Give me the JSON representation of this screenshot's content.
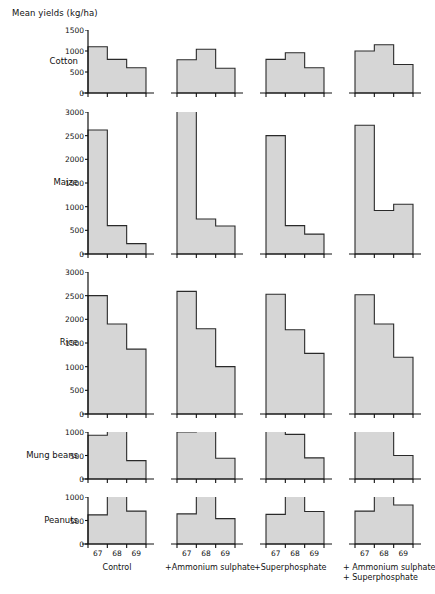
{
  "title": "Mean yields (kg/ha)",
  "colors": {
    "bar_fill": "#d6d6d6",
    "bar_stroke": "#2a2a2a",
    "axis": "#111111",
    "background": "#ffffff"
  },
  "x_tick_labels": [
    "67",
    "68",
    "69"
  ],
  "treatments": [
    {
      "id": "control",
      "label": "Control"
    },
    {
      "id": "ammonium-sulphate",
      "label": "+Ammonium sulphate"
    },
    {
      "id": "superphosphate",
      "label": "+Superphosphate"
    },
    {
      "id": "ammonium-sulphate-superphosphate",
      "label": "+ Ammonium sulphate\n+ Superphosphate"
    }
  ],
  "crops": [
    {
      "id": "cotton",
      "label": "Cotton",
      "ymax": 1500,
      "ystep": 500,
      "yticks": [
        0,
        500,
        1000,
        1500
      ]
    },
    {
      "id": "maize",
      "label": "Maize",
      "ymax": 3000,
      "ystep": 500,
      "yticks": [
        0,
        500,
        1000,
        1500,
        2000,
        2500,
        3000
      ]
    },
    {
      "id": "rice",
      "label": "Rice",
      "ymax": 3000,
      "ystep": 500,
      "yticks": [
        0,
        500,
        1000,
        1500,
        2000,
        2500,
        3000
      ]
    },
    {
      "id": "mung-beans",
      "label": "Mung beans",
      "ymax": 1000,
      "ystep": 500,
      "yticks": [
        0,
        500,
        1000
      ]
    },
    {
      "id": "peanuts",
      "label": "Peanuts",
      "ymax": 1000,
      "ystep": 500,
      "yticks": [
        0,
        500,
        1000
      ]
    }
  ],
  "chart_data": {
    "type": "bar",
    "title": "Mean yields (kg/ha)",
    "xlabel": "",
    "ylabel": "Mean yields (kg/ha)",
    "grid": false,
    "legend": "none",
    "layout": "small-multiples grid: 5 crop rows x 4 treatment columns",
    "categories": [
      "67",
      "68",
      "69"
    ],
    "panels": [
      {
        "crop": "Cotton",
        "treatment": "Control",
        "ylim": [
          0,
          1500
        ],
        "values": [
          1100,
          800,
          600
        ]
      },
      {
        "crop": "Cotton",
        "treatment": "+Ammonium sulphate",
        "ylim": [
          0,
          1500
        ],
        "values": [
          790,
          1040,
          590
        ]
      },
      {
        "crop": "Cotton",
        "treatment": "+Superphosphate",
        "ylim": [
          0,
          1500
        ],
        "values": [
          800,
          960,
          600
        ]
      },
      {
        "crop": "Cotton",
        "treatment": "+ Ammonium sulphate + Superphosphate",
        "ylim": [
          0,
          1500
        ],
        "values": [
          1000,
          1150,
          680
        ]
      },
      {
        "crop": "Maize",
        "treatment": "Control",
        "ylim": [
          0,
          3000
        ],
        "values": [
          2620,
          600,
          220
        ]
      },
      {
        "crop": "Maize",
        "treatment": "+Ammonium sulphate",
        "ylim": [
          0,
          3000
        ],
        "values": [
          3080,
          740,
          590
        ]
      },
      {
        "crop": "Maize",
        "treatment": "+Superphosphate",
        "ylim": [
          0,
          3000
        ],
        "values": [
          2500,
          600,
          420
        ]
      },
      {
        "crop": "Maize",
        "treatment": "+ Ammonium sulphate + Superphosphate",
        "ylim": [
          0,
          3000
        ],
        "values": [
          2720,
          920,
          1050
        ]
      },
      {
        "crop": "Rice",
        "treatment": "Control",
        "ylim": [
          0,
          3000
        ],
        "values": [
          2500,
          1900,
          1370
        ]
      },
      {
        "crop": "Rice",
        "treatment": "+Ammonium sulphate",
        "ylim": [
          0,
          3000
        ],
        "values": [
          2590,
          1800,
          1000
        ]
      },
      {
        "crop": "Rice",
        "treatment": "+Superphosphate",
        "ylim": [
          0,
          3000
        ],
        "values": [
          2530,
          1780,
          1280
        ]
      },
      {
        "crop": "Rice",
        "treatment": "+ Ammonium sulphate + Superphosphate",
        "ylim": [
          0,
          3000
        ],
        "values": [
          2520,
          1900,
          1200
        ]
      },
      {
        "crop": "Mung beans",
        "treatment": "Control",
        "ylim": [
          0,
          1000
        ],
        "values": [
          930,
          1100,
          390
        ]
      },
      {
        "crop": "Mung beans",
        "treatment": "+Ammonium sulphate",
        "ylim": [
          0,
          1000
        ],
        "values": [
          1000,
          1060,
          440
        ]
      },
      {
        "crop": "Mung beans",
        "treatment": "+Superphosphate",
        "ylim": [
          0,
          1000
        ],
        "values": [
          1090,
          950,
          450
        ]
      },
      {
        "crop": "Mung beans",
        "treatment": "+ Ammonium sulphate + Superphosphate",
        "ylim": [
          0,
          1000
        ],
        "values": [
          1060,
          1110,
          500
        ]
      },
      {
        "crop": "Peanuts",
        "treatment": "Control",
        "ylim": [
          0,
          1000
        ],
        "values": [
          620,
          1150,
          700
        ]
      },
      {
        "crop": "Peanuts",
        "treatment": "+Ammonium sulphate",
        "ylim": [
          0,
          1000
        ],
        "values": [
          640,
          1160,
          540
        ]
      },
      {
        "crop": "Peanuts",
        "treatment": "+Superphosphate",
        "ylim": [
          0,
          1000
        ],
        "values": [
          630,
          1150,
          690
        ]
      },
      {
        "crop": "Peanuts",
        "treatment": "+ Ammonium sulphate + Superphosphate",
        "ylim": [
          0,
          1000
        ],
        "values": [
          700,
          1150,
          830
        ]
      }
    ]
  },
  "geometry": {
    "panel_left": [
      88,
      177,
      266,
      355
    ],
    "panel_width": 58,
    "rows": [
      {
        "crop": "cotton",
        "top": 30,
        "height": 63
      },
      {
        "crop": "maize",
        "top": 112,
        "height": 142
      },
      {
        "crop": "rice",
        "top": 272,
        "height": 142
      },
      {
        "crop": "mung-beans",
        "top": 432,
        "height": 47
      },
      {
        "crop": "peanuts",
        "top": 497,
        "height": 47
      }
    ]
  }
}
